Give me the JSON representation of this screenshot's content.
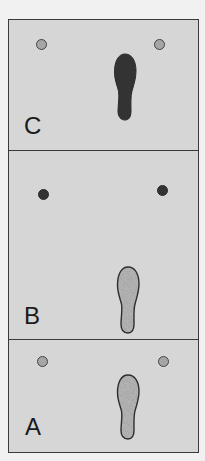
{
  "diagram": {
    "type": "stacked-panels",
    "colors": {
      "panel_background": "#d6d6d6",
      "border": "#3a3a3a",
      "footprint_dark": "#333333",
      "footprint_stippled": "#b4b4b4",
      "marker_hollow_fill": "#a6a6a6",
      "marker_filled": "#333333"
    },
    "panels": [
      {
        "label": "C",
        "markers": [
          {
            "position": "left",
            "style": "hollow"
          },
          {
            "position": "right",
            "style": "hollow"
          }
        ],
        "footprint": {
          "style": "solid-dark"
        }
      },
      {
        "label": "B",
        "markers": [
          {
            "position": "left",
            "style": "filled"
          },
          {
            "position": "right",
            "style": "filled"
          }
        ],
        "footprint": {
          "style": "stippled-outlined"
        }
      },
      {
        "label": "A",
        "markers": [
          {
            "position": "left",
            "style": "hollow"
          },
          {
            "position": "right",
            "style": "hollow"
          }
        ],
        "footprint": {
          "style": "stippled-outlined"
        }
      }
    ]
  }
}
